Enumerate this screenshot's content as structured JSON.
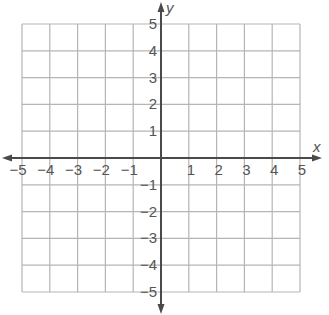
{
  "diagram": {
    "type": "coordinate-plane",
    "x_axis_label": "x",
    "y_axis_label": "y",
    "x_range": [
      -5,
      5
    ],
    "y_range": [
      -5,
      5
    ],
    "x_ticks": [
      "−5",
      "−4",
      "−3",
      "−2",
      "−1",
      "1",
      "2",
      "3",
      "4",
      "5"
    ],
    "y_ticks_positive": [
      "5",
      "4",
      "3",
      "2",
      "1"
    ],
    "y_ticks_negative": [
      "−1",
      "−2",
      "−3",
      "−4",
      "−5"
    ],
    "grid": true,
    "colors": {
      "grid": "#b5b5b5",
      "axis": "#4a4a4a",
      "text": "#555555"
    }
  }
}
